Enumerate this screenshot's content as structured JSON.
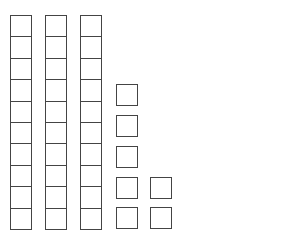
{
  "diagram": {
    "type": "base-ten-blocks",
    "stroke_color": "#444444",
    "fill_color": "#ffffff",
    "background": "#ffffff",
    "tens_rods": [
      {
        "x": 10,
        "y": 15,
        "cells": 10
      },
      {
        "x": 45,
        "y": 15,
        "cells": 10
      },
      {
        "x": 80,
        "y": 15,
        "cells": 10
      }
    ],
    "cell_size": {
      "w": 22,
      "h": 21.4
    },
    "units": [
      {
        "x": 116,
        "y": 84
      },
      {
        "x": 116,
        "y": 115
      },
      {
        "x": 116,
        "y": 146
      },
      {
        "x": 116,
        "y": 177
      },
      {
        "x": 116,
        "y": 207
      },
      {
        "x": 150,
        "y": 177
      },
      {
        "x": 150,
        "y": 207
      }
    ],
    "unit_size": 22,
    "tens_count": 3,
    "ones_count": 7
  }
}
